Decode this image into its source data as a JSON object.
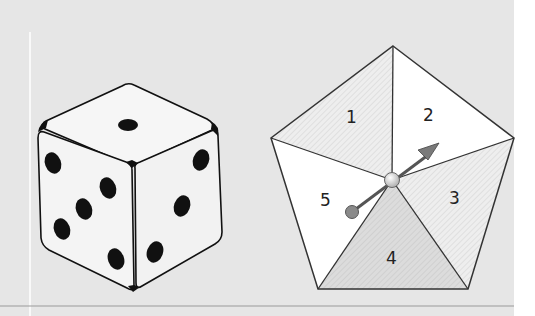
{
  "figure": {
    "background_color": "#e6e6e6",
    "die": {
      "top_face_pips": 1,
      "left_face_pips": 5,
      "right_face_pips": 4
    },
    "spinner": {
      "sections": [
        {
          "label": "1",
          "shading": "hatched"
        },
        {
          "label": "2",
          "shading": "white"
        },
        {
          "label": "3",
          "shading": "hatched"
        },
        {
          "label": "4",
          "shading": "hatched-dark"
        },
        {
          "label": "5",
          "shading": "white"
        }
      ],
      "arrow_color": "#7a7a7a"
    }
  }
}
